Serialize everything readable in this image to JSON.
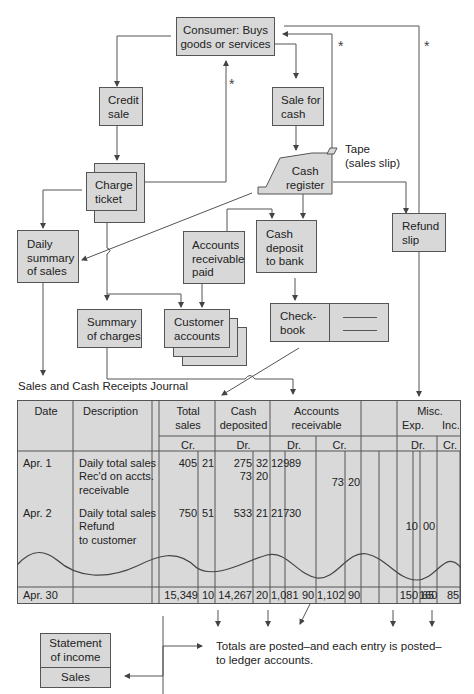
{
  "flowchart": {
    "consumer": "Consumer: Buys goods or services",
    "consumer_lines": [
      "Consumer: Buys",
      "goods or services"
    ],
    "credit_sale": [
      "Credit",
      "sale"
    ],
    "sale_for_cash": [
      "Sale for",
      "cash"
    ],
    "charge_ticket": [
      "Charge",
      "ticket"
    ],
    "cash_register": [
      "Cash",
      "register"
    ],
    "tape_label": [
      "Tape",
      "(sales slip)"
    ],
    "daily_summary": [
      "Daily",
      "summary",
      "of sales"
    ],
    "accounts_receivable_paid": [
      "Accounts",
      "receivable",
      "paid"
    ],
    "cash_deposit": [
      "Cash",
      "deposit",
      "to bank"
    ],
    "refund_slip": [
      "Refund",
      "slip"
    ],
    "summary_of_charges": [
      "Summary",
      "of charges"
    ],
    "customer_accounts": [
      "Customer",
      "accounts"
    ],
    "checkbook": [
      "Check-",
      "book"
    ],
    "asterisk": "*"
  },
  "journal": {
    "title": "Sales and Cash Receipts Journal",
    "headers": {
      "date": "Date",
      "description": "Description",
      "total_sales": [
        "Total",
        "sales"
      ],
      "total_sales_sub": "Cr.",
      "cash_deposited": [
        "Cash",
        "deposited"
      ],
      "cash_deposited_sub": "Dr.",
      "accounts_receivable": [
        "Accounts",
        "receivable"
      ],
      "ar_dr": "Dr.",
      "ar_cr": "Cr.",
      "misc": "Misc.",
      "misc_exp": "Exp.",
      "misc_inc": "Inc.",
      "misc_dr": "Dr.",
      "misc_cr": "Cr."
    },
    "rows": [
      {
        "date": "Apr. 1",
        "description": "Daily total sales",
        "total_sales": [
          "405",
          "21"
        ],
        "cash_deposited": [
          "275",
          "32"
        ],
        "ar_dr": [
          "129",
          "89"
        ]
      },
      {
        "date": "",
        "description": "Rec'd on accts.",
        "cash_deposited": [
          "73",
          "20"
        ],
        "ar_cr": [
          "73",
          "20"
        ]
      },
      {
        "date": "",
        "description": "receivable"
      },
      {
        "date": "Apr. 2",
        "description": "Daily total sales",
        "total_sales": [
          "750",
          "51"
        ],
        "cash_deposited": [
          "533",
          "21"
        ],
        "ar_dr": [
          "217",
          "30"
        ]
      },
      {
        "date": "",
        "description": "Refund",
        "misc_exp_dr": [
          "10",
          "00"
        ]
      },
      {
        "date": "",
        "description": "to customer"
      }
    ],
    "totals": {
      "date": "Apr. 30",
      "total_sales": [
        "15,349",
        "10"
      ],
      "cash_deposited": [
        "14,267",
        "20"
      ],
      "ar_dr": [
        "1,081",
        "90"
      ],
      "ar_cr": [
        "1,102",
        "90"
      ],
      "misc_exp_dr": [
        "150",
        "65"
      ],
      "misc_inc_cr": [
        "160",
        "85"
      ]
    }
  },
  "statement": {
    "title": [
      "Statement",
      "of income"
    ],
    "sub": "Sales"
  },
  "footnote": [
    "Totals are posted–and each entry is posted–",
    "to ledger accounts."
  ],
  "colors": {
    "box_fill": "#d8d8d8",
    "line": "#555555"
  }
}
